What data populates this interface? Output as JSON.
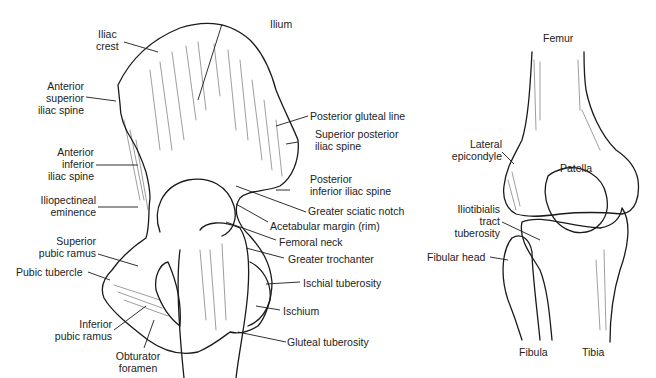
{
  "figure": {
    "panels": [
      {
        "name": "hip",
        "labels": {
          "iliac_crest": [
            "Iliac",
            "crest"
          ],
          "ilium": "Ilium",
          "asis": [
            "Anterior",
            "superior",
            "iliac spine"
          ],
          "aiis": [
            "Anterior",
            "inferior",
            "iliac spine"
          ],
          "iliopectineal": [
            "Iliopectineal",
            "eminence"
          ],
          "sup_pubic_ramus": [
            "Superior",
            "pubic ramus"
          ],
          "pubic_tubercle": "Pubic tubercle",
          "inf_pubic_ramus": [
            "Inferior",
            "pubic ramus"
          ],
          "obturator": [
            "Obturator",
            "foramen"
          ],
          "post_gluteal_line": "Posterior gluteal line",
          "psis": [
            "Superior posterior",
            "iliac spine"
          ],
          "piis": [
            "Posterior",
            "inferior iliac spine"
          ],
          "greater_sciatic": "Greater sciatic notch",
          "acetabular_margin": "Acetabular margin (rim)",
          "femoral_neck": "Femoral neck",
          "greater_trochanter": "Greater trochanter",
          "ischial_tuberosity": "Ischial tuberosity",
          "ischium": "Ischium",
          "gluteal_tuberosity": "Gluteal tuberosity"
        }
      },
      {
        "name": "knee",
        "labels": {
          "femur": "Femur",
          "lateral_epicondyle": [
            "Lateral",
            "epicondyle"
          ],
          "patella": "Patella",
          "iliotibialis": [
            "Iliotibialis",
            "tract",
            "tuberosity"
          ],
          "fibular_head": "Fibular head",
          "fibula": "Fibula",
          "tibia": "Tibia"
        }
      }
    ],
    "colors": {
      "ink": "#1a1a1a",
      "background": "#ffffff"
    }
  }
}
